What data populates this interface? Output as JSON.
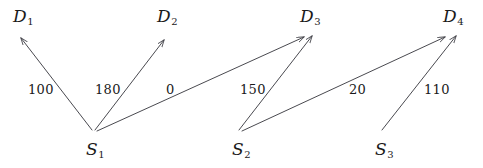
{
  "diagram": {
    "background_color": "#ffffff",
    "line_color": "#3f3f46",
    "text_color": "#1a1a1a",
    "sources": [
      {
        "id": "S1",
        "letter": "S",
        "sub": "1",
        "x": 94,
        "y": 132,
        "label_x": 86,
        "label_y": 141
      },
      {
        "id": "S2",
        "letter": "S",
        "sub": "2",
        "x": 240,
        "y": 132,
        "label_x": 232,
        "label_y": 141
      },
      {
        "id": "S3",
        "letter": "S",
        "sub": "3",
        "x": 383,
        "y": 132,
        "label_x": 375,
        "label_y": 141
      }
    ],
    "destinations": [
      {
        "id": "D1",
        "letter": "D",
        "sub": "1",
        "x": 20,
        "y": 38,
        "label_x": 13,
        "label_y": 8
      },
      {
        "id": "D2",
        "letter": "D",
        "sub": "2",
        "x": 165,
        "y": 40,
        "label_x": 157,
        "label_y": 8
      },
      {
        "id": "D3",
        "letter": "D",
        "sub": "3",
        "x": 308,
        "y": 37,
        "label_x": 300,
        "label_y": 8
      },
      {
        "id": "D4",
        "letter": "D",
        "sub": "4",
        "x": 450,
        "y": 37,
        "label_x": 443,
        "label_y": 8
      }
    ],
    "edges": [
      {
        "id": "S1-D1",
        "from": "S1",
        "to": "D1",
        "cost": "100",
        "x1": 92,
        "y1": 130,
        "x2": 21,
        "y2": 38,
        "label_x": 28,
        "label_y": 83
      },
      {
        "id": "S1-D2",
        "from": "S1",
        "to": "D2",
        "cost": "180",
        "x1": 95,
        "y1": 130,
        "x2": 164,
        "y2": 40,
        "label_x": 95,
        "label_y": 83
      },
      {
        "id": "S1-D3",
        "from": "S1",
        "to": "D3",
        "cost": "0",
        "x1": 97,
        "y1": 131,
        "x2": 304,
        "y2": 37,
        "label_x": 166,
        "label_y": 83
      },
      {
        "id": "S2-D3",
        "from": "S2",
        "to": "D3",
        "cost": "150",
        "x1": 239,
        "y1": 130,
        "x2": 312,
        "y2": 36,
        "label_x": 240,
        "label_y": 83
      },
      {
        "id": "S2-D4",
        "from": "S2",
        "to": "D4",
        "cost": "20",
        "x1": 242,
        "y1": 131,
        "x2": 445,
        "y2": 37,
        "label_x": 349,
        "label_y": 83
      },
      {
        "id": "S3-D4",
        "from": "S3",
        "to": "D4",
        "cost": "110",
        "x1": 382,
        "y1": 130,
        "x2": 456,
        "y2": 36,
        "label_x": 424,
        "label_y": 83
      }
    ]
  }
}
